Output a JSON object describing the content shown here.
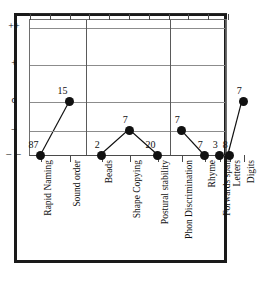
{
  "chart_data": {
    "type": "scatter",
    "title": "",
    "subtitle": "",
    "xlabel": "",
    "ylabel": "",
    "grid": true,
    "legend": null,
    "y_axis": {
      "type": "ordinal",
      "ticks": [
        "++",
        "+",
        "o",
        "–",
        "– –"
      ],
      "tick_order_top_to_bottom": [
        "++",
        "+",
        "o",
        "–",
        "– –"
      ],
      "bottom_tick_style": "dashed"
    },
    "categories": [
      "Rapid Naming",
      "Sound order",
      "Beads",
      "Shape Copying",
      "Postural stability",
      "Phon Discrimination",
      "Rhyme",
      "Forwards span",
      "Letters",
      "Digits"
    ],
    "point_labels": [
      "87",
      "15",
      "2",
      "7",
      "20",
      "7",
      "7",
      "3",
      "8",
      "7"
    ],
    "values": [
      "– –",
      "o",
      "– –",
      "–",
      "– –",
      "–",
      "– –",
      "– –",
      "– –",
      "o"
    ],
    "value_levels": [
      4,
      2,
      4,
      3,
      4,
      3,
      4,
      4,
      4,
      2
    ],
    "group_separators_after": [
      1,
      4,
      7
    ],
    "connected_runs": [
      [
        0,
        1
      ],
      [
        2,
        3,
        4
      ],
      [
        5,
        6
      ],
      [
        8,
        9
      ]
    ],
    "marker": "filled-circle",
    "marker_color": "#111111",
    "line_color": "#111111"
  },
  "figure": {
    "frame_color": "#1a1a1a",
    "grid_color": "#8c8c8c",
    "background": "#ffffff"
  }
}
